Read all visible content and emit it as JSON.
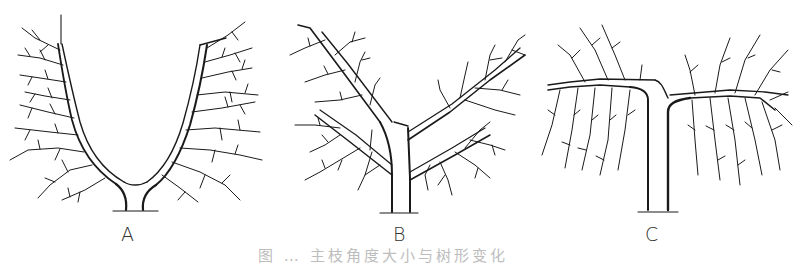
{
  "figure": {
    "panels": [
      {
        "label": "A",
        "description": "Open-center V-shaped tree, two upright main limbs with lateral branches"
      },
      {
        "label": "B",
        "description": "Tree with central trunk and two oblique main limbs with lateral branches"
      },
      {
        "label": "C",
        "description": "Tree with horizontal main limbs and drooping (weeping) branches"
      }
    ],
    "caption": "图 … 主枝角度大小与树形变化",
    "colors": {
      "line": "#1a1a1a",
      "background": "#ffffff",
      "label": "#333333",
      "caption": "#bdbdbd"
    }
  }
}
